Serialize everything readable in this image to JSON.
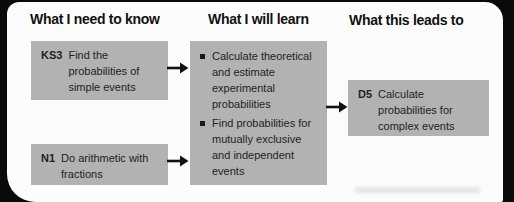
{
  "colors": {
    "background": "#0a0a0a",
    "card": "#fcfcfc",
    "heading": "#111111",
    "box": "#b2b2b2",
    "text": "#222222",
    "arrow": "#111111"
  },
  "headings": {
    "col1": "What I need to know",
    "col2": "What I will learn",
    "col3": "What this leads to"
  },
  "prior_boxes": [
    {
      "code": "KS3",
      "text": "Find the\nprobabilities of\nsimple events"
    },
    {
      "code": "N1",
      "text": "Do arithmetic with\nfractions"
    }
  ],
  "learn_box": {
    "bullets": [
      "Calculate theoretical\nand estimate\nexperimental\nprobabilities",
      "Find probabilities for\nmutually exclusive\nand independent\nevents"
    ]
  },
  "leads_box": {
    "code": "D5",
    "text": "Calculate\nprobabilities for\ncomplex events"
  }
}
